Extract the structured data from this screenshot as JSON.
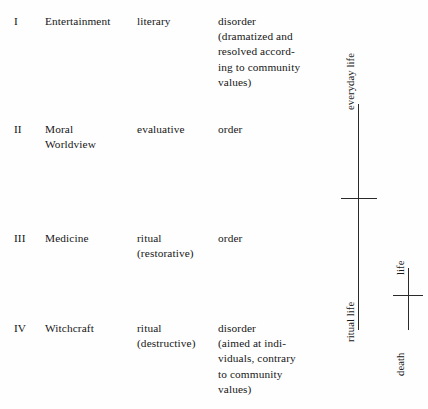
{
  "figure": {
    "background_color": "#fefefe",
    "ink_color": "#171717"
  },
  "table": {
    "columns": [
      "numeral",
      "domain",
      "mode",
      "effect"
    ],
    "rows": [
      {
        "numeral": "I",
        "domain": "Entertainment",
        "mode": "literary",
        "effect": "disorder\n(dramatized and\nresolved accord-\ning to community\nvalues)"
      },
      {
        "numeral": "II",
        "domain": "Moral\nWorldview",
        "mode": "evaluative",
        "effect": "order"
      },
      {
        "numeral": "III",
        "domain": "Medicine",
        "mode": "ritual\n(restorative)",
        "effect": "order"
      },
      {
        "numeral": "IV",
        "domain": "Witchcraft",
        "mode": "ritual\n(destructive)",
        "effect": "disorder\n(aimed at indi-\nviduals, contrary\nto community\nvalues)"
      }
    ]
  },
  "axes": {
    "primary": {
      "top_label": "everyday life",
      "bottom_label": "ritual life"
    },
    "secondary": {
      "top_label": "life",
      "bottom_label": "death"
    }
  }
}
